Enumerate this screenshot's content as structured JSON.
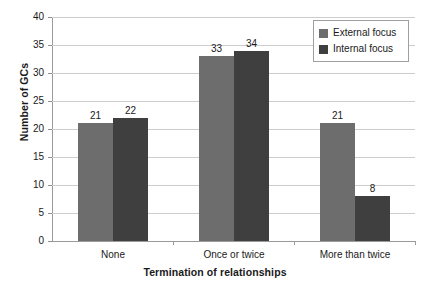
{
  "chart_data": {
    "type": "bar",
    "title": "",
    "xlabel": "Termination of relationships",
    "ylabel": "Number of GCs",
    "categories": [
      "None",
      "Once or twice",
      "More than twice"
    ],
    "series": [
      {
        "name": "External focus",
        "color": "#6d6d6d",
        "values": [
          21,
          33,
          21
        ]
      },
      {
        "name": "Internal focus",
        "color": "#3f3f3f",
        "values": [
          22,
          34,
          8
        ]
      }
    ],
    "ylim": [
      0,
      40
    ],
    "yticks": [
      0,
      5,
      10,
      15,
      20,
      25,
      30,
      35,
      40
    ],
    "ytick_labels": [
      "0",
      "5",
      "10",
      "15",
      "20",
      "25",
      "30",
      "35",
      "40"
    ],
    "grid": true,
    "grid_axis": "y",
    "legend_position": "top-right",
    "data_labels": [
      [
        "21",
        "22"
      ],
      [
        "33",
        "34"
      ],
      [
        "21",
        "8"
      ]
    ],
    "background_color": "#ffffff",
    "gridline_color": "#cdcdcd",
    "axis_color": "#9a9a9a"
  }
}
